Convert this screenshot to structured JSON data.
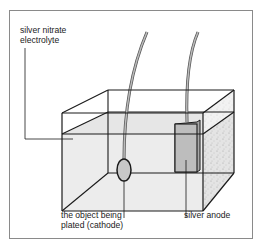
{
  "diagram": {
    "labels": {
      "electrolyte_line1": "silver nitrate",
      "electrolyte_line2": "electrolyte",
      "cathode_line1": "the object being",
      "cathode_line2": "plated (cathode)",
      "anode": "silver anode"
    },
    "colors": {
      "frame": "#8a8a8a",
      "outline": "#1a1a1a",
      "electrolyte": "#eeeeee",
      "anode": "#b9b9b9",
      "cathode": "#c8c8c8",
      "wire": "#9a9a9a"
    }
  }
}
